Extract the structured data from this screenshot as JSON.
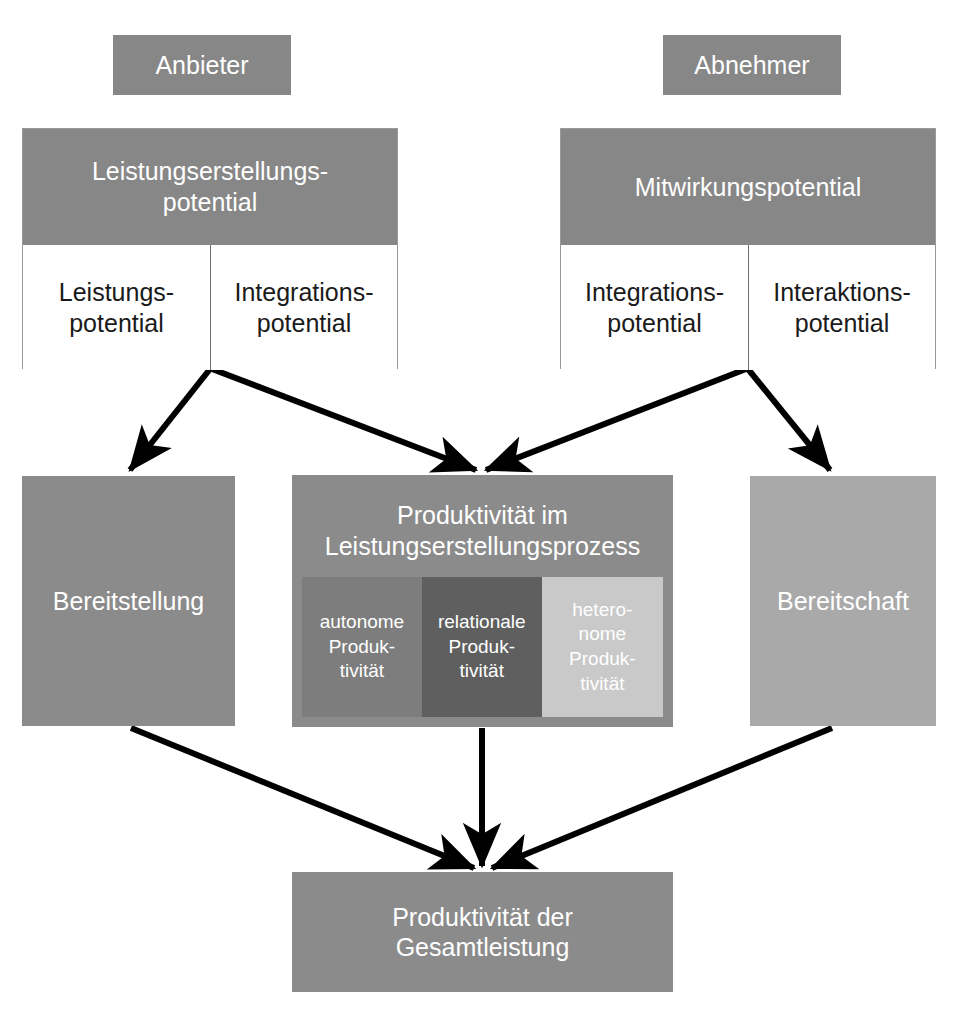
{
  "diagram": {
    "title": "Produktivität der Gesamtleistung",
    "colors": {
      "chip": "#878787",
      "header": "#878787",
      "block_mid": "#8b8b8b",
      "block_light": "#a9a9a9",
      "sub_autonome": "#7d7d7d",
      "sub_relationale": "#5f5f5f",
      "sub_heteronome": "#c9c9c9",
      "arrow": "#000000",
      "cell_bg": "#ffffff",
      "cell_border": "#6e6e6e"
    },
    "actors": {
      "provider": "Anbieter",
      "customer": "Abnehmer"
    },
    "provider_group": {
      "header": "Leistungserstellungs-\npotential",
      "cells": [
        {
          "label": "Leistungs-\npotential"
        },
        {
          "label": "Integrations-\npotential"
        }
      ]
    },
    "customer_group": {
      "header": "Mitwirkungspotential",
      "cells": [
        {
          "label": "Integrations-\npotential"
        },
        {
          "label": "Interaktions-\npotential"
        }
      ]
    },
    "left_block": "Bereitstellung",
    "right_block": "Bereitschaft",
    "process": {
      "title": "Produktivität im\nLeistungserstellungsprozess",
      "subs": [
        {
          "label": "autonome\nProduk-\ntivität",
          "color": "#7d7d7d"
        },
        {
          "label": "relationale\nProduk-\ntivität",
          "color": "#5f5f5f"
        },
        {
          "label": "hetero-\nnome\nProduk-\ntivität",
          "color": "#c9c9c9"
        }
      ]
    },
    "result_block": "Produktivität der\nGesamtleistung",
    "arrows": [
      {
        "name": "provider-to-bereitstellung",
        "from": "Leistungserstellungspotential",
        "to": "Bereitstellung"
      },
      {
        "name": "provider-to-prozess",
        "from": "Leistungserstellungspotential",
        "to": "Produktivität im Leistungserstellungsprozess"
      },
      {
        "name": "customer-to-prozess",
        "from": "Mitwirkungspotential",
        "to": "Produktivität im Leistungserstellungsprozess"
      },
      {
        "name": "customer-to-bereitschaft",
        "from": "Mitwirkungspotential",
        "to": "Bereitschaft"
      },
      {
        "name": "bereitstellung-to-result",
        "from": "Bereitstellung",
        "to": "Produktivität der Gesamtleistung"
      },
      {
        "name": "prozess-to-result",
        "from": "Produktivität im Leistungserstellungsprozess",
        "to": "Produktivität der Gesamtleistung"
      },
      {
        "name": "bereitschaft-to-result",
        "from": "Bereitschaft",
        "to": "Produktivität der Gesamtleistung"
      }
    ]
  }
}
